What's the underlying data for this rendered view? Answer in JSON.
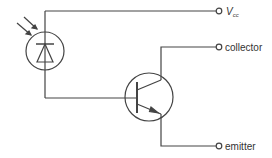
{
  "diagram": {
    "colors": {
      "line": "#444444",
      "background": "#ffffff"
    },
    "components": [
      {
        "id": "photodiode",
        "type": "photodiode",
        "icon": "photodiode-icon",
        "light_arrows": 2
      },
      {
        "id": "transistor",
        "type": "npn-transistor",
        "icon": "npn-transistor-icon"
      }
    ],
    "terminals": {
      "vcc": {
        "label_main": "V",
        "label_sub": "cc"
      },
      "collector": {
        "label": "collector"
      },
      "emitter": {
        "label": "emitter"
      }
    }
  }
}
